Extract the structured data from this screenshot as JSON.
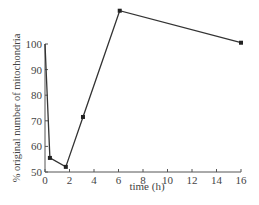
{
  "chart_data": {
    "type": "line",
    "title": "",
    "xlabel": "time (h)",
    "ylabel": "% original number of mitochondria",
    "xlim": [
      0,
      16
    ],
    "ylim": [
      50,
      100
    ],
    "x_ticks": [
      0,
      2,
      4,
      6,
      8,
      10,
      12,
      14,
      16
    ],
    "y_ticks": [
      50,
      60,
      70,
      80,
      90,
      100
    ],
    "grid": false,
    "legend": null,
    "series": [
      {
        "name": "mitochondria",
        "x": [
          0,
          0.4,
          1.7,
          3.1,
          6.1,
          16
        ],
        "values": [
          100,
          55.5,
          52,
          71.5,
          113,
          100.5
        ]
      }
    ],
    "colors": {
      "line": "#333333",
      "axis": "#555555",
      "text": "#444444"
    }
  }
}
